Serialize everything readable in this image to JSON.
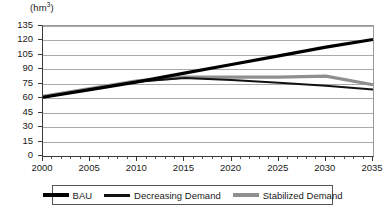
{
  "chart_data": {
    "type": "line",
    "title": "",
    "subtitle": "",
    "unit_label": "(hm",
    "unit_label_sup": "3",
    "unit_label_close": ")",
    "ylabel": "hm3",
    "xlabel": "",
    "ylim": [
      0,
      135
    ],
    "xlim": [
      2000,
      2035
    ],
    "grid": true,
    "legend_position": "bottom",
    "yticks": [
      0,
      15,
      30,
      45,
      60,
      75,
      90,
      105,
      120,
      135
    ],
    "ytick_labels": [
      "0",
      "15",
      "30",
      "45",
      "60",
      "75",
      "90",
      "105",
      "120",
      "135"
    ],
    "xticks": [
      2000,
      2005,
      2010,
      2015,
      2020,
      2025,
      2030,
      2035
    ],
    "xtick_labels": [
      "2000",
      "2005",
      "2010",
      "2015",
      "2020",
      "2025",
      "2030",
      "2035"
    ],
    "x_minor_tick_step": 1,
    "x": [
      2000,
      2005,
      2010,
      2015,
      2020,
      2025,
      2030,
      2035
    ],
    "series": [
      {
        "name": "BAU",
        "color": "#000000",
        "width": 3.2,
        "values": [
          61,
          69,
          77,
          86,
          95,
          104,
          113,
          121
        ]
      },
      {
        "name": "Decreasing Demand",
        "color": "#111111",
        "width": 2.0,
        "values": [
          61,
          69,
          77,
          81,
          79,
          76,
          73,
          69
        ]
      },
      {
        "name": "Stabilized Demand",
        "color": "#8f8f8f",
        "width": 3.2,
        "values": [
          62,
          70,
          78,
          82,
          82,
          82,
          83,
          74
        ]
      }
    ],
    "legend": [
      {
        "label": "BAU",
        "swatch": "bau"
      },
      {
        "label": "Decreasing Demand",
        "swatch": "decr"
      },
      {
        "label": "Stabilized Demand",
        "swatch": "stab"
      }
    ],
    "colors": {
      "bau": "#000000",
      "decreasing": "#111111",
      "stabilized": "#8f8f8f",
      "gridline": "#aaaaaa",
      "axis": "#333333",
      "background": "#ffffff"
    }
  }
}
